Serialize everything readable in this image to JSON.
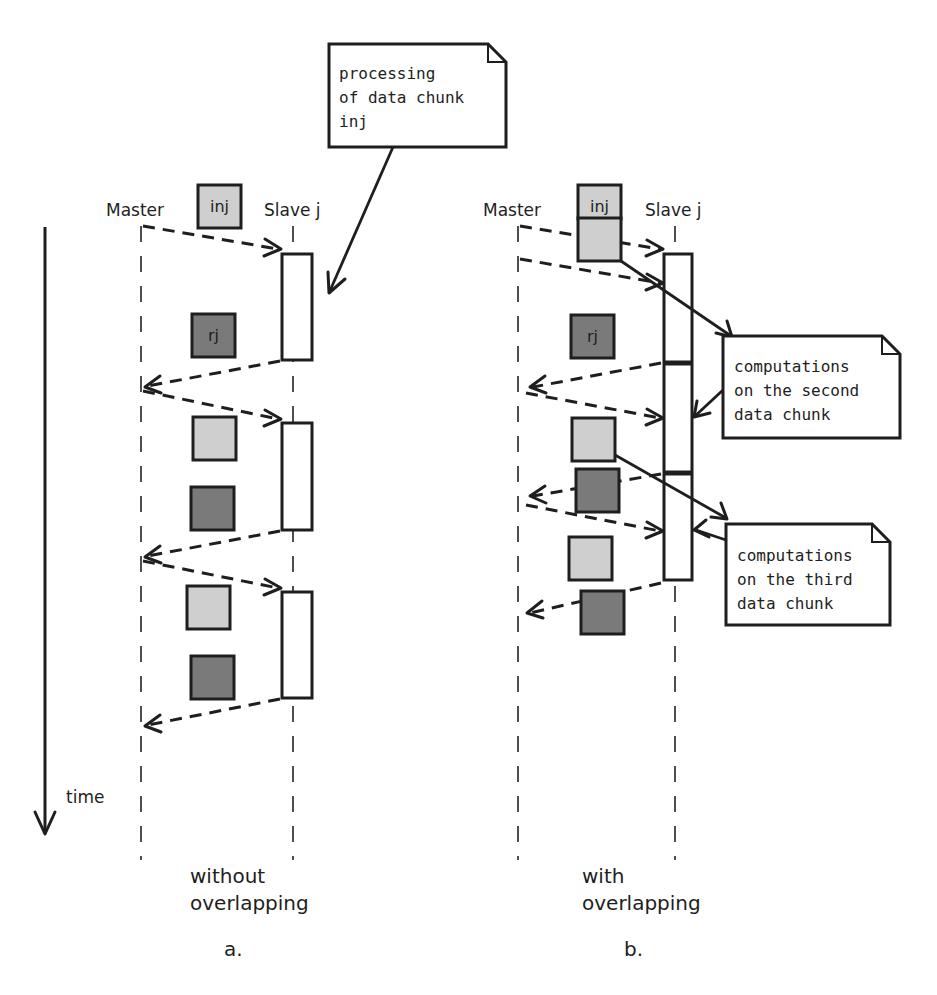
{
  "diagram": {
    "type": "sequence-diagram",
    "time_axis_label": "time",
    "panel_a": {
      "master_label": "Master",
      "slave_label": "Slave j",
      "input_chunk_label": "inj",
      "result_chunk_label": "rj",
      "note": [
        "processing",
        "of data chunk",
        "inj"
      ],
      "caption": [
        "without",
        "overlapping"
      ],
      "panel_letter": "a."
    },
    "panel_b": {
      "master_label": "Master",
      "slave_label": "Slave j",
      "input_chunk_label": "inj",
      "result_chunk_label": "rj",
      "note_second": [
        "computations",
        "on the second",
        "data chunk"
      ],
      "note_third": [
        "computations",
        "on the third",
        "data chunk"
      ],
      "caption": [
        "with",
        "overlapping"
      ],
      "panel_letter": "b."
    },
    "colors": {
      "input_chunk": "#cfcfcf",
      "result_chunk": "#7a7a7a",
      "stroke": "#1e1e1e",
      "background": "#ffffff"
    }
  }
}
